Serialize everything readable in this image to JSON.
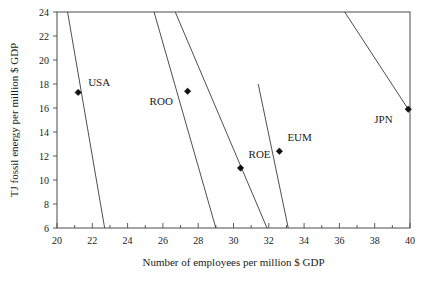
{
  "chart_data": {
    "type": "scatter",
    "title": "",
    "xlabel": "Number of employees per million $ GDP",
    "ylabel": "TJ fossil energy per million $ GDP",
    "xlim": [
      20,
      40
    ],
    "ylim": [
      6,
      24
    ],
    "xticks": [
      20,
      22,
      24,
      26,
      28,
      30,
      32,
      34,
      36,
      38,
      40
    ],
    "xtick_labels": [
      "20",
      "22",
      "24",
      "26",
      "28",
      "30",
      "32",
      "34",
      "36",
      "38",
      "40"
    ],
    "yticks": [
      6,
      8,
      10,
      12,
      14,
      16,
      18,
      20,
      22,
      24
    ],
    "ytick_labels": [
      "6",
      "8",
      "10",
      "12",
      "14",
      "16",
      "18",
      "20",
      "22",
      "24"
    ],
    "xminor_step": 1,
    "grid": false,
    "legend": "none",
    "points": [
      {
        "label": "USA",
        "x": 21.2,
        "y": 17.3,
        "label_dx": 10,
        "label_dy": -6
      },
      {
        "label": "ROO",
        "x": 27.4,
        "y": 17.4,
        "label_dx": -38,
        "label_dy": 14
      },
      {
        "label": "ROE",
        "x": 30.4,
        "y": 11.0,
        "label_dx": 8,
        "label_dy": -10
      },
      {
        "label": "EUM",
        "x": 32.6,
        "y": 12.4,
        "label_dx": 8,
        "label_dy": -10
      },
      {
        "label": "JPN",
        "x": 39.9,
        "y": 15.9,
        "label_dx": -34,
        "label_dy": 14
      }
    ],
    "series": [
      {
        "name": "USA",
        "x": [
          20.6,
          22.7
        ],
        "values": [
          24.0,
          6.0
        ]
      },
      {
        "name": "ROO",
        "x": [
          25.5,
          29.0
        ],
        "values": [
          24.0,
          6.0
        ]
      },
      {
        "name": "ROE",
        "x": [
          26.7,
          31.9
        ],
        "values": [
          24.0,
          6.0
        ]
      },
      {
        "name": "EUM",
        "x": [
          31.4,
          33.1
        ],
        "values": [
          18.0,
          6.0
        ]
      },
      {
        "name": "JPN",
        "x": [
          36.3,
          39.9
        ],
        "values": [
          24.0,
          15.9
        ]
      }
    ]
  }
}
